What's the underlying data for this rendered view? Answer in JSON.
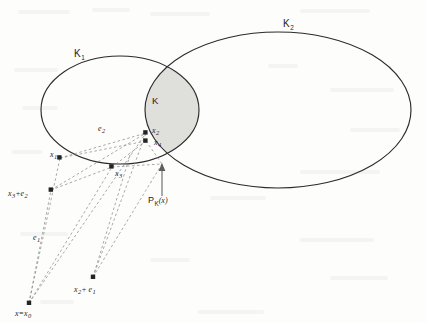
{
  "figure": {
    "background_color": "#fdfdfc",
    "ink_color": "#2b2b2b",
    "dash_color": "#8d8d8a",
    "lens_fill_color": "#d9d9d6"
  },
  "sets": {
    "k1": {
      "label": "K",
      "subscript": "1",
      "cx": 120,
      "cy": 110,
      "rx": 79,
      "ry": 54
    },
    "k2": {
      "label": "K",
      "subscript": "2",
      "cx": 278,
      "cy": 110,
      "rx": 133,
      "ry": 78
    },
    "intersection": {
      "label": "K"
    }
  },
  "points": [
    {
      "name": "x1",
      "base": "x",
      "subscript": "1",
      "x": 60,
      "y": 158,
      "label_dx": -10,
      "label_dy": -3
    },
    {
      "name": "x3",
      "base": "x",
      "subscript": "3",
      "x": 112,
      "y": 167,
      "label_dx": 3,
      "label_dy": 8
    },
    {
      "name": "x2",
      "base": "x",
      "subscript": "2",
      "x": 146,
      "y": 133,
      "label_dx": 7,
      "label_dy": -3
    },
    {
      "name": "x4",
      "base": "x",
      "subscript": "4",
      "x": 146,
      "y": 141,
      "label_dx": 9,
      "label_dy": 8
    },
    {
      "name": "x3_plus_e2",
      "base": "x",
      "subscript": "3",
      "x": 51,
      "y": 190,
      "label_dx": -45,
      "label_dy": 6
    },
    {
      "name": "x2_plus_e1",
      "base": "x",
      "subscript": "2",
      "x": 93,
      "y": 277,
      "label_dx": -19,
      "label_dy": 14
    },
    {
      "name": "x0",
      "base": "x",
      "subscript": "0",
      "x": 29,
      "y": 303,
      "label_dx": -18,
      "label_dy": 11
    },
    {
      "name": "pk_x",
      "base": "P",
      "subscript": "K",
      "x": 162,
      "y": 164,
      "label_dx": -14,
      "label_dy": 34
    }
  ],
  "labels": {
    "k1": "K",
    "k1_sub": "1",
    "k2": "K",
    "k2_sub": "2",
    "k_intersection": "K",
    "x1": "x",
    "x1_sub": "1",
    "x2": "x",
    "x2_sub": "2",
    "x3": "x",
    "x3_sub": "3",
    "x4": "x",
    "x4_sub": "4",
    "e1": "e",
    "e1_sub": "1",
    "e2": "e",
    "e2_sub": "2",
    "x3_plus_e2_base": "x",
    "x3_plus_e2_sub": "3",
    "x3_plus_e2_op": "+e",
    "x3_plus_e2_opsub": "2",
    "x2_plus_e1_base": "x",
    "x2_plus_e1_sub": "2",
    "x2_plus_e1_op": "+ e",
    "x2_plus_e1_opsub": "1",
    "pk_base": "P",
    "pk_sub": "K",
    "pk_arg": "(x)",
    "x_equals_x0_lhs": "x=x",
    "x_equals_x0_sub": "0"
  }
}
